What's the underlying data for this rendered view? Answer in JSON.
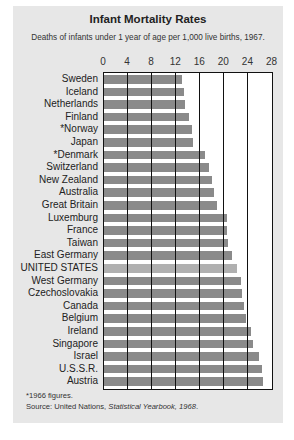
{
  "chart_data": {
    "type": "bar",
    "orientation": "horizontal",
    "title": "Infant Mortality Rates",
    "subtitle": "Deaths of infants under 1 year of age per 1,000 live births, 1967.",
    "xlabel": "",
    "ylabel": "",
    "xlim": [
      0,
      28
    ],
    "x_ticks": [
      "0",
      "4",
      "8",
      "12",
      "16",
      "20",
      "24",
      "28"
    ],
    "grid": true,
    "highlight": "UNITED STATES",
    "categories": [
      "Sweden",
      "Iceland",
      "Netherlands",
      "Finland",
      "*Norway",
      "Japan",
      "*Denmark",
      "Switzerland",
      "New Zealand",
      "Australia",
      "Great Britain",
      "Luxemburg",
      "France",
      "Taiwan",
      "East Germany",
      "UNITED STATES",
      "West Germany",
      "Czechoslovakia",
      "Canada",
      "Belgium",
      "Ireland",
      "Singapore",
      "Israel",
      "U.S.S.R.",
      "Austria"
    ],
    "values": [
      12.9,
      13.3,
      13.4,
      14.2,
      14.6,
      14.8,
      16.8,
      17.5,
      18.0,
      18.3,
      18.7,
      20.4,
      20.5,
      20.6,
      21.2,
      22.1,
      22.8,
      22.9,
      23.2,
      23.6,
      24.4,
      24.8,
      25.8,
      26.3,
      26.5
    ],
    "footnotes": [
      "*1966 figures.",
      "Source: United Nations, Statistical Yearbook, 1968."
    ]
  },
  "header": {
    "title": "Infant Mortality Rates",
    "subtitle": "Deaths of infants under 1 year of age per 1,000 live births, 1967."
  },
  "footer": {
    "note": "*1966 figures.",
    "source_prefix": "Source: United Nations, ",
    "source_title": "Statistical Yearbook, 1968",
    "source_suffix": "."
  },
  "colors": {
    "panel": "#e7e7e7",
    "bar": "#8a8a8a",
    "bar_highlight": "#b0b0b0",
    "grid": "#111111"
  }
}
